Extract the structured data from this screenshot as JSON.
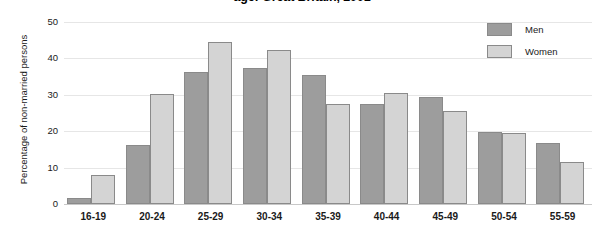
{
  "chart_data": {
    "type": "bar",
    "title": "age: Great Britain, 2001",
    "xlabel": "",
    "ylabel": "Percentage of non-married persons",
    "ylim": [
      0,
      50
    ],
    "yticks": [
      0,
      10,
      20,
      30,
      40,
      50
    ],
    "grid": true,
    "legend_position": "top-right",
    "categories": [
      "16-19",
      "20-24",
      "25-29",
      "30-34",
      "35-39",
      "40-44",
      "45-49",
      "50-54",
      "55-59"
    ],
    "series": [
      {
        "name": "Men",
        "color": "#9d9d9d",
        "values": [
          1.7,
          16.2,
          36.2,
          37.5,
          35.4,
          27.5,
          29.5,
          19.7,
          16.8
        ]
      },
      {
        "name": "Women",
        "color": "#d4d4d4",
        "values": [
          8.0,
          30.1,
          44.4,
          42.4,
          27.4,
          30.4,
          25.5,
          19.6,
          11.5
        ]
      }
    ]
  },
  "legend": {
    "items": [
      {
        "label": "Men"
      },
      {
        "label": "Women"
      }
    ]
  }
}
